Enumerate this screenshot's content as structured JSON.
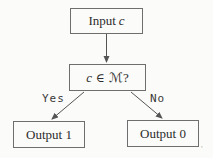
{
  "diagram": {
    "nodes": {
      "input": {
        "prefix": "Input",
        "var": "c"
      },
      "decision": {
        "var": "c",
        "operator": "∈",
        "set": "ℳ",
        "question": "?"
      },
      "output1": {
        "label": "Output 1"
      },
      "output0": {
        "label": "Output 0"
      }
    },
    "edges": {
      "yes_label": "Yes",
      "no_label": "No"
    },
    "artifact_mark": "'",
    "colors": {
      "background": "#fbfbf9",
      "box_border": "#6e6e6e",
      "text": "#2d2d2d",
      "arrow": "#555555",
      "edge_label_text": "#3a3a3a"
    }
  }
}
